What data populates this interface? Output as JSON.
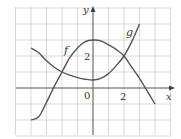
{
  "chart_data": {
    "type": "line",
    "title": "",
    "xlabel": "x",
    "ylabel": "y",
    "xlim": [
      -5,
      5
    ],
    "ylim": [
      -3,
      5
    ],
    "grid": true,
    "x_tick_labels": [
      {
        "value": 0,
        "label": "0"
      },
      {
        "value": 2,
        "label": "2"
      }
    ],
    "y_tick_labels": [
      {
        "value": 2,
        "label": "2"
      }
    ],
    "series": [
      {
        "name": "f",
        "points": [
          [
            -4,
            -2
          ],
          [
            -3.5,
            -1.8
          ],
          [
            -3,
            -0.9
          ],
          [
            -2.5,
            0.1
          ],
          [
            -2,
            1
          ],
          [
            -1.5,
            1.9
          ],
          [
            -1,
            2.5
          ],
          [
            -0.5,
            2.9
          ],
          [
            0,
            3
          ],
          [
            0.5,
            2.95
          ],
          [
            1,
            2.7
          ],
          [
            1.5,
            2.4
          ],
          [
            2,
            2
          ],
          [
            2.5,
            1.3
          ],
          [
            3,
            0.6
          ],
          [
            3.5,
            -0.2
          ],
          [
            4,
            -1
          ]
        ]
      },
      {
        "name": "g",
        "points": [
          [
            -4,
            2.5
          ],
          [
            -3.5,
            2.2
          ],
          [
            -3,
            1.7
          ],
          [
            -2.5,
            1.3
          ],
          [
            -2,
            1
          ],
          [
            -1.5,
            0.8
          ],
          [
            -1,
            0.65
          ],
          [
            -0.5,
            0.55
          ],
          [
            0,
            0.5
          ],
          [
            0.5,
            0.6
          ],
          [
            1,
            0.9
          ],
          [
            1.5,
            1.4
          ],
          [
            2,
            2
          ],
          [
            2.5,
            2.9
          ],
          [
            3,
            4
          ]
        ]
      }
    ],
    "annotations": [
      {
        "text": "f",
        "x": -1.7,
        "y": 2.4
      },
      {
        "text": "g",
        "x": 2.3,
        "y": 3.5
      }
    ],
    "intersections": [
      [
        -2,
        1
      ],
      [
        2,
        2
      ]
    ]
  },
  "labels": {
    "x_axis": "x",
    "y_axis": "y",
    "origin": "0",
    "x_tick_2": "2",
    "y_tick_2": "2",
    "curve_f": "f",
    "curve_g": "g"
  },
  "colors": {
    "curve": "#555555",
    "grid": "#cfcfcf",
    "axis": "#555555"
  }
}
